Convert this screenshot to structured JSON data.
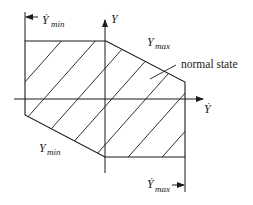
{
  "diagram": {
    "type": "operating-envelope",
    "axes": {
      "vertical": {
        "label": "Y"
      },
      "horizontal": {
        "label": "Ẏ"
      }
    },
    "labels": {
      "ydot_min": {
        "base": "Ẏ",
        "sub": "min"
      },
      "ydot_max": {
        "base": "Ẏ",
        "sub": "max"
      },
      "y_max": {
        "base": "Y",
        "sub": "max"
      },
      "y_min": {
        "base": "Y",
        "sub": "min"
      },
      "region": "normal state"
    },
    "colors": {
      "line": "#1a1a1a",
      "background": "#ffffff"
    },
    "region_vertices": [
      [
        25,
        41
      ],
      [
        106,
        41
      ],
      [
        185,
        82
      ],
      [
        185,
        157
      ],
      [
        105,
        157
      ],
      [
        25,
        115
      ]
    ]
  }
}
